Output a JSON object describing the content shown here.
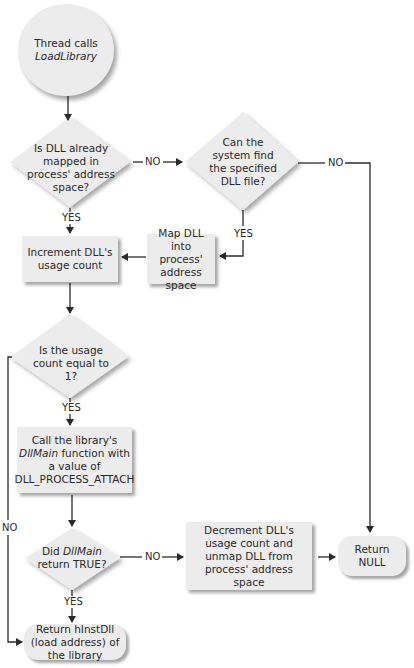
{
  "diagram": {
    "type": "flowchart",
    "start": {
      "line1": "Thread calls",
      "line2_italic": "LoadLibrary"
    },
    "decision_mapped": {
      "text": "Is DLL already mapped in process' address space?"
    },
    "decision_find": {
      "text": "Can the system find the specified DLL file?"
    },
    "process_increment": {
      "text": "Increment DLL's usage count"
    },
    "process_map": {
      "text": "Map DLL into process' address space"
    },
    "decision_count": {
      "text": "Is the usage count equal to 1?"
    },
    "process_call": {
      "pre": "Call the library's ",
      "italic": "DllMain",
      "post": " function with a value of DLL_PROCESS_ATTACH"
    },
    "decision_dllmain": {
      "pre": "Did ",
      "italic": "DllMain",
      "post": " return TRUE?"
    },
    "process_decrement": {
      "text": "Decrement DLL's usage count and unmap DLL from process' address space"
    },
    "end_null": {
      "text": "Return NULL"
    },
    "end_hinst": {
      "text": "Return hInstDll (load address) of the library"
    },
    "labels": {
      "yes": "YES",
      "no": "NO"
    },
    "colors": {
      "shape_fill": "#ececec",
      "line": "#2a2a2a",
      "background": "#ffffff"
    }
  }
}
